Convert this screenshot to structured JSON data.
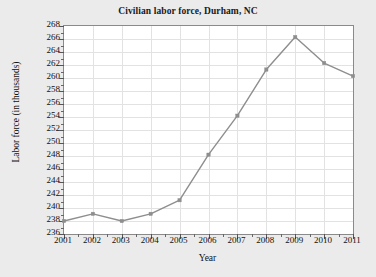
{
  "chart_data": {
    "type": "line",
    "title": "Civilian labor force, Durham, NC",
    "xlabel": "Year",
    "ylabel": "Labor force (in thousands)",
    "categories": [
      2001,
      2002,
      2003,
      2004,
      2005,
      2006,
      2007,
      2008,
      2009,
      2010,
      2011
    ],
    "x_tick_labels": [
      "2001",
      "2002",
      "2003",
      "2004",
      "2005",
      "2006",
      "2007",
      "2008",
      "2009",
      "2010",
      "2011"
    ],
    "values": [
      238.0,
      239.1,
      238.0,
      239.1,
      241.2,
      248.2,
      254.2,
      261.3,
      266.3,
      262.3,
      260.3
    ],
    "series": [
      {
        "name": "Civilian labor force",
        "values": [
          238.0,
          239.1,
          238.0,
          239.1,
          241.2,
          248.2,
          254.2,
          261.3,
          266.3,
          262.3,
          260.3
        ]
      }
    ],
    "y_tick_labels": [
      "268",
      "266",
      "264",
      "262",
      "260",
      "258",
      "256",
      "254",
      "252",
      "250",
      "248",
      "246",
      "244",
      "242",
      "240",
      "238",
      "236"
    ],
    "y_ticks": [
      268,
      266,
      264,
      262,
      260,
      258,
      256,
      254,
      252,
      250,
      248,
      246,
      244,
      242,
      240,
      238,
      236
    ],
    "ylim": [
      236,
      268
    ],
    "xlim": [
      2001,
      2011
    ],
    "grid": true,
    "legend": "none",
    "line_color": "#8e8e8e",
    "marker_color": "#8e8e8e",
    "marker_shape": "square",
    "plot_background": "#ffffff",
    "figure_background": "#ebebeb",
    "gridline_color": "#e2e2e2",
    "axis_color": "#8a8a8a",
    "text_color": "#111111"
  }
}
